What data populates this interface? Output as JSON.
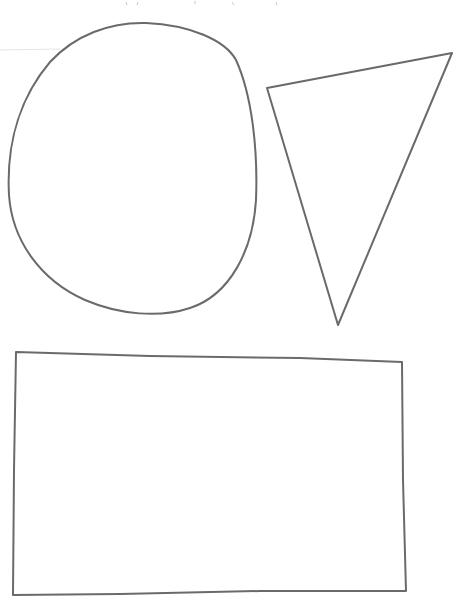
{
  "page": {
    "background": "#ffffff",
    "stroke_color": "#6a6a6a",
    "stroke_width": 2
  },
  "shapes": [
    {
      "type": "oval",
      "label": "oval",
      "cx": 132,
      "cy": 168,
      "rx": 124,
      "ry": 146
    },
    {
      "type": "triangle",
      "label": "triangle",
      "points": [
        [
          267,
          88
        ],
        [
          452,
          53
        ],
        [
          338,
          325
        ]
      ]
    },
    {
      "type": "rectangle",
      "label": "rectangle",
      "points": [
        [
          16,
          352
        ],
        [
          402,
          362
        ],
        [
          406,
          591
        ],
        [
          13,
          595
        ]
      ]
    }
  ]
}
